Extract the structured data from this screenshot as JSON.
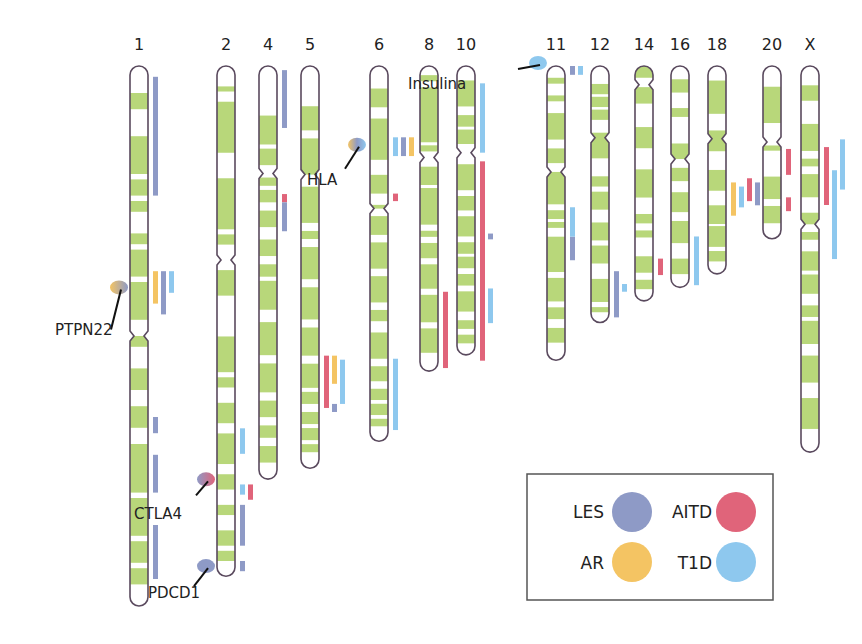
{
  "colors": {
    "band": "#b8d77a",
    "band_light": "#dcecb8",
    "outline": "#5a4a5e",
    "LES": "#8e9ac6",
    "AITD": "#e0647a",
    "AR": "#f4c463",
    "T1D": "#8ec8ee"
  },
  "legend": [
    {
      "key": "LES",
      "label": "LES"
    },
    {
      "key": "AITD",
      "label": "AITD"
    },
    {
      "key": "AR",
      "label": "AR"
    },
    {
      "key": "T1D",
      "label": "T1D"
    }
  ],
  "chromosomes": [
    {
      "id": "1",
      "label": "1",
      "length": 1.0,
      "centromere": 0.5,
      "bands": [
        [
          0.05,
          0.08
        ],
        [
          0.13,
          0.2
        ],
        [
          0.21,
          0.24
        ],
        [
          0.25,
          0.27
        ],
        [
          0.31,
          0.33
        ],
        [
          0.34,
          0.39
        ],
        [
          0.4,
          0.47
        ],
        [
          0.5,
          0.52
        ],
        [
          0.56,
          0.6
        ],
        [
          0.63,
          0.67
        ],
        [
          0.7,
          0.79
        ],
        [
          0.8,
          0.87
        ],
        [
          0.88,
          0.92
        ],
        [
          0.93,
          0.96
        ]
      ],
      "loci": [
        {
          "disease": "LES",
          "start": 0.02,
          "end": 0.24
        },
        {
          "disease": "AR",
          "start": 0.38,
          "end": 0.44
        },
        {
          "disease": "LES",
          "start": 0.38,
          "end": 0.46
        },
        {
          "disease": "T1D",
          "start": 0.38,
          "end": 0.42
        },
        {
          "disease": "LES",
          "start": 0.65,
          "end": 0.68
        },
        {
          "disease": "LES",
          "start": 0.72,
          "end": 0.79
        },
        {
          "disease": "LES",
          "start": 0.85,
          "end": 0.95
        }
      ]
    },
    {
      "id": "2",
      "label": "2",
      "length": 0.945,
      "centromere": 0.38,
      "bands": [
        [
          0.04,
          0.05
        ],
        [
          0.07,
          0.17
        ],
        [
          0.22,
          0.32
        ],
        [
          0.33,
          0.35
        ],
        [
          0.4,
          0.45
        ],
        [
          0.53,
          0.6
        ],
        [
          0.61,
          0.63
        ],
        [
          0.66,
          0.7
        ],
        [
          0.72,
          0.78
        ],
        [
          0.8,
          0.83
        ],
        [
          0.86,
          0.88
        ],
        [
          0.91,
          0.94
        ],
        [
          0.95,
          0.97
        ]
      ],
      "loci": [
        {
          "disease": "T1D",
          "start": 0.71,
          "end": 0.76
        },
        {
          "disease": "T1D",
          "start": 0.82,
          "end": 0.84
        },
        {
          "disease": "AITD",
          "start": 0.82,
          "end": 0.85
        },
        {
          "disease": "LES",
          "start": 0.86,
          "end": 0.94
        },
        {
          "disease": "LES",
          "start": 0.97,
          "end": 0.99
        }
      ]
    },
    {
      "id": "4",
      "label": "4",
      "length": 0.765,
      "centromere": 0.26,
      "bands": [
        [
          0.12,
          0.19
        ],
        [
          0.2,
          0.24
        ],
        [
          0.27,
          0.29
        ],
        [
          0.3,
          0.33
        ],
        [
          0.35,
          0.39
        ],
        [
          0.42,
          0.46
        ],
        [
          0.48,
          0.51
        ],
        [
          0.52,
          0.59
        ],
        [
          0.62,
          0.7
        ],
        [
          0.72,
          0.79
        ],
        [
          0.81,
          0.85
        ],
        [
          0.87,
          0.9
        ],
        [
          0.92,
          0.96
        ]
      ],
      "loci": [
        {
          "disease": "LES",
          "start": 0.01,
          "end": 0.15
        },
        {
          "disease": "AITD",
          "start": 0.31,
          "end": 0.33
        },
        {
          "disease": "LES",
          "start": 0.33,
          "end": 0.4
        }
      ]
    },
    {
      "id": "5",
      "label": "5",
      "length": 0.745,
      "centromere": 0.27,
      "bands": [
        [
          0.1,
          0.16
        ],
        [
          0.18,
          0.27
        ],
        [
          0.3,
          0.39
        ],
        [
          0.41,
          0.43
        ],
        [
          0.45,
          0.53
        ],
        [
          0.55,
          0.63
        ],
        [
          0.65,
          0.72
        ],
        [
          0.74,
          0.8
        ],
        [
          0.81,
          0.84
        ],
        [
          0.86,
          0.89
        ],
        [
          0.9,
          0.93
        ],
        [
          0.94,
          0.96
        ]
      ],
      "loci": [
        {
          "disease": "AITD",
          "start": 0.72,
          "end": 0.85
        },
        {
          "disease": "AR",
          "start": 0.72,
          "end": 0.79
        },
        {
          "disease": "LES",
          "start": 0.84,
          "end": 0.86
        },
        {
          "disease": "T1D",
          "start": 0.73,
          "end": 0.84
        }
      ]
    },
    {
      "id": "6",
      "label": "6",
      "length": 0.695,
      "centromere": 0.38,
      "bands": [
        [
          0.06,
          0.11
        ],
        [
          0.14,
          0.25
        ],
        [
          0.29,
          0.34
        ],
        [
          0.37,
          0.38
        ],
        [
          0.4,
          0.45
        ],
        [
          0.47,
          0.54
        ],
        [
          0.56,
          0.63
        ],
        [
          0.65,
          0.68
        ],
        [
          0.71,
          0.78
        ],
        [
          0.8,
          0.84
        ],
        [
          0.86,
          0.89
        ],
        [
          0.9,
          0.93
        ],
        [
          0.94,
          0.96
        ]
      ],
      "loci": [
        {
          "disease": "T1D",
          "start": 0.19,
          "end": 0.24
        },
        {
          "disease": "LES",
          "start": 0.19,
          "end": 0.24
        },
        {
          "disease": "AR",
          "start": 0.19,
          "end": 0.24
        },
        {
          "disease": "AITD",
          "start": 0.34,
          "end": 0.36
        },
        {
          "disease": "T1D",
          "start": 0.78,
          "end": 0.97
        }
      ]
    },
    {
      "id": "8",
      "label": "8",
      "length": 0.565,
      "centromere": 0.3,
      "bands": [
        [
          0.03,
          0.05
        ],
        [
          0.07,
          0.25
        ],
        [
          0.26,
          0.28
        ],
        [
          0.33,
          0.39
        ],
        [
          0.4,
          0.52
        ],
        [
          0.54,
          0.56
        ],
        [
          0.58,
          0.63
        ],
        [
          0.65,
          0.73
        ],
        [
          0.75,
          0.84
        ],
        [
          0.86,
          0.94
        ]
      ],
      "loci": [
        {
          "disease": "AITD",
          "start": 0.74,
          "end": 0.99
        }
      ]
    },
    {
      "id": "10",
      "label": "10",
      "length": 0.535,
      "centromere": 0.3,
      "bands": [
        [
          0.05,
          0.14
        ],
        [
          0.17,
          0.21
        ],
        [
          0.22,
          0.27
        ],
        [
          0.34,
          0.43
        ],
        [
          0.45,
          0.5
        ],
        [
          0.52,
          0.59
        ],
        [
          0.61,
          0.65
        ],
        [
          0.66,
          0.7
        ],
        [
          0.72,
          0.76
        ],
        [
          0.78,
          0.85
        ],
        [
          0.88,
          0.91
        ],
        [
          0.93,
          0.96
        ]
      ],
      "loci": [
        {
          "disease": "T1D",
          "start": 0.06,
          "end": 0.3
        },
        {
          "disease": "AITD",
          "start": 0.33,
          "end": 1.02
        },
        {
          "disease": "LES",
          "start": 0.58,
          "end": 0.6
        },
        {
          "disease": "T1D",
          "start": 0.77,
          "end": 0.89
        }
      ]
    },
    {
      "id": "11",
      "label": "11",
      "length": 0.545,
      "centromere": 0.36,
      "bands": [
        [
          0.04,
          0.06
        ],
        [
          0.1,
          0.12
        ],
        [
          0.16,
          0.25
        ],
        [
          0.28,
          0.33
        ],
        [
          0.36,
          0.47
        ],
        [
          0.49,
          0.52
        ],
        [
          0.53,
          0.55
        ],
        [
          0.58,
          0.7
        ],
        [
          0.72,
          0.8
        ],
        [
          0.82,
          0.86
        ],
        [
          0.89,
          0.94
        ]
      ],
      "loci": [
        {
          "disease": "LES",
          "start": 0.0,
          "end": 0.03
        },
        {
          "disease": "T1D",
          "start": 0.0,
          "end": 0.03
        },
        {
          "disease": "LES",
          "start": 0.58,
          "end": 0.66
        },
        {
          "disease": "T1D",
          "start": 0.48,
          "end": 0.58
        }
      ]
    },
    {
      "id": "12",
      "label": "12",
      "length": 0.475,
      "centromere": 0.28,
      "bands": [
        [
          0.07,
          0.11
        ],
        [
          0.12,
          0.16
        ],
        [
          0.17,
          0.21
        ],
        [
          0.26,
          0.36
        ],
        [
          0.43,
          0.47
        ],
        [
          0.49,
          0.56
        ],
        [
          0.61,
          0.68
        ],
        [
          0.7,
          0.77
        ],
        [
          0.83,
          0.92
        ],
        [
          0.94,
          0.96
        ]
      ],
      "loci": [
        {
          "disease": "LES",
          "start": 0.8,
          "end": 0.98
        },
        {
          "disease": "T1D",
          "start": 0.85,
          "end": 0.88
        }
      ]
    },
    {
      "id": "14",
      "label": "14",
      "length": 0.435,
      "centromere": 0.08,
      "bands": [
        [
          0.0,
          0.05
        ],
        [
          0.09,
          0.16
        ],
        [
          0.26,
          0.35
        ],
        [
          0.44,
          0.56
        ],
        [
          0.63,
          0.67
        ],
        [
          0.7,
          0.73
        ],
        [
          0.81,
          0.88
        ],
        [
          0.91,
          0.95
        ]
      ],
      "loci": [
        {
          "disease": "AITD",
          "start": 0.82,
          "end": 0.89
        }
      ]
    },
    {
      "id": "16",
      "label": "16",
      "length": 0.41,
      "centromere": 0.42,
      "bands": [
        [
          0.06,
          0.12
        ],
        [
          0.19,
          0.23
        ],
        [
          0.35,
          0.42
        ],
        [
          0.46,
          0.52
        ],
        [
          0.57,
          0.66
        ],
        [
          0.7,
          0.8
        ],
        [
          0.87,
          0.94
        ]
      ],
      "loci": [
        {
          "disease": "T1D",
          "start": 0.77,
          "end": 0.99
        }
      ]
    },
    {
      "id": "18",
      "label": "18",
      "length": 0.385,
      "centromere": 0.35,
      "bands": [
        [
          0.07,
          0.23
        ],
        [
          0.31,
          0.41
        ],
        [
          0.5,
          0.6
        ],
        [
          0.67,
          0.76
        ],
        [
          0.77,
          0.87
        ],
        [
          0.89,
          0.94
        ]
      ],
      "loci": [
        {
          "disease": "AR",
          "start": 0.56,
          "end": 0.72
        },
        {
          "disease": "T1D",
          "start": 0.58,
          "end": 0.68
        },
        {
          "disease": "AITD",
          "start": 0.54,
          "end": 0.65
        },
        {
          "disease": "LES",
          "start": 0.56,
          "end": 0.67
        }
      ]
    },
    {
      "id": "20",
      "label": "20",
      "length": 0.32,
      "centromere": 0.44,
      "bands": [
        [
          0.12,
          0.33
        ],
        [
          0.46,
          0.49
        ],
        [
          0.64,
          0.77
        ],
        [
          0.81,
          0.91
        ]
      ],
      "loci": [
        {
          "disease": "AITD",
          "start": 0.48,
          "end": 0.63
        },
        {
          "disease": "AITD",
          "start": 0.76,
          "end": 0.84
        }
      ]
    },
    {
      "id": "X",
      "label": "X",
      "length": 0.715,
      "centromere": 0.41,
      "bands": [
        [
          0.05,
          0.09
        ],
        [
          0.15,
          0.22
        ],
        [
          0.24,
          0.26
        ],
        [
          0.28,
          0.34
        ],
        [
          0.38,
          0.41
        ],
        [
          0.43,
          0.45
        ],
        [
          0.48,
          0.53
        ],
        [
          0.54,
          0.59
        ],
        [
          0.62,
          0.65
        ],
        [
          0.66,
          0.72
        ],
        [
          0.75,
          0.82
        ],
        [
          0.86,
          0.94
        ]
      ],
      "loci": [
        {
          "disease": "AITD",
          "start": 0.21,
          "end": 0.36
        },
        {
          "disease": "T1D",
          "start": 0.27,
          "end": 0.5
        },
        {
          "disease": "T1D",
          "start": 0.19,
          "end": 0.32
        }
      ]
    }
  ],
  "genes": [
    {
      "id": "PTPN22",
      "label": "PTPN22",
      "chromosome": "1",
      "colors": [
        "AR",
        "LES"
      ]
    },
    {
      "id": "CTLA4",
      "label": "CTLA4",
      "chromosome": "2",
      "colors": [
        "LES",
        "AITD"
      ]
    },
    {
      "id": "PDCD1",
      "label": "PDCD1",
      "chromosome": "2",
      "colors": [
        "LES",
        "LES"
      ]
    },
    {
      "id": "HLA",
      "label": "HLA",
      "chromosome": "6",
      "colors": [
        "AR",
        "LES",
        "T1D"
      ]
    },
    {
      "id": "Insulina",
      "label": "Insulina",
      "chromosome": "11",
      "colors": [
        "T1D",
        "T1D"
      ]
    }
  ]
}
